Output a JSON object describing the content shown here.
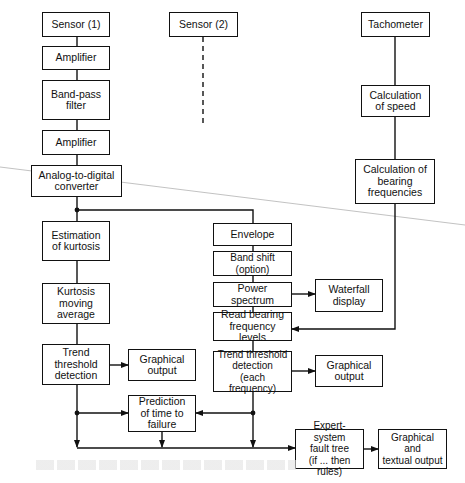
{
  "diagram": {
    "nodes": {
      "sensor1": "Sensor (1)",
      "amplifier1": "Amplifier",
      "bandpass": "Band-pass\nfilter",
      "amplifier2": "Amplifier",
      "adc": "Analog-to-digital\nconverter",
      "sensor2": "Sensor (2)",
      "tachometer": "Tachometer",
      "calc_speed": "Calculation\nof speed",
      "calc_bearing": "Calculation of\nbearing\nfrequencies",
      "est_kurtosis": "Estimation\nof kurtosis",
      "kurt_moving_avg": "Kurtosis\nmoving\naverage",
      "trend_left": "Trend\nthreshold\ndetection",
      "graph_out_left": "Graphical\noutput",
      "envelope": "Envelope",
      "band_shift": "Band shift (option)",
      "power_spectrum": "Power spectrum",
      "waterfall": "Waterfall\ndisplay",
      "read_bearing": "Read bearing\nfrequency levels",
      "trend_right": "Trend threshold\ndetection\n(each frequency)",
      "graph_out_right": "Graphical\noutput",
      "prediction": "Prediction\nof time to\nfailure",
      "expert_system": "Expert-system\nfault tree\n(if ... then rules)",
      "graph_text_out": "Graphical\nand\ntextual output"
    },
    "edges": [
      [
        "sensor1",
        "amplifier1"
      ],
      [
        "amplifier1",
        "bandpass"
      ],
      [
        "bandpass",
        "amplifier2"
      ],
      [
        "amplifier2",
        "adc"
      ],
      [
        "adc",
        "est_kurtosis"
      ],
      [
        "adc",
        "envelope"
      ],
      [
        "sensor2",
        "adc (dashed)"
      ],
      [
        "tachometer",
        "calc_speed"
      ],
      [
        "calc_speed",
        "calc_bearing"
      ],
      [
        "calc_bearing",
        "read_bearing"
      ],
      [
        "est_kurtosis",
        "kurt_moving_avg"
      ],
      [
        "kurt_moving_avg",
        "trend_left"
      ],
      [
        "trend_left",
        "graph_out_left"
      ],
      [
        "trend_left",
        "prediction"
      ],
      [
        "trend_left",
        "expert_system"
      ],
      [
        "envelope",
        "band_shift"
      ],
      [
        "band_shift",
        "power_spectrum"
      ],
      [
        "power_spectrum",
        "waterfall"
      ],
      [
        "power_spectrum",
        "read_bearing"
      ],
      [
        "read_bearing",
        "trend_right"
      ],
      [
        "trend_right",
        "graph_out_right"
      ],
      [
        "trend_right",
        "prediction"
      ],
      [
        "trend_right",
        "expert_system"
      ],
      [
        "prediction",
        "expert_system"
      ],
      [
        "expert_system",
        "graph_text_out"
      ]
    ],
    "colors": {
      "stroke": "#111111",
      "background": "#ffffff"
    }
  }
}
